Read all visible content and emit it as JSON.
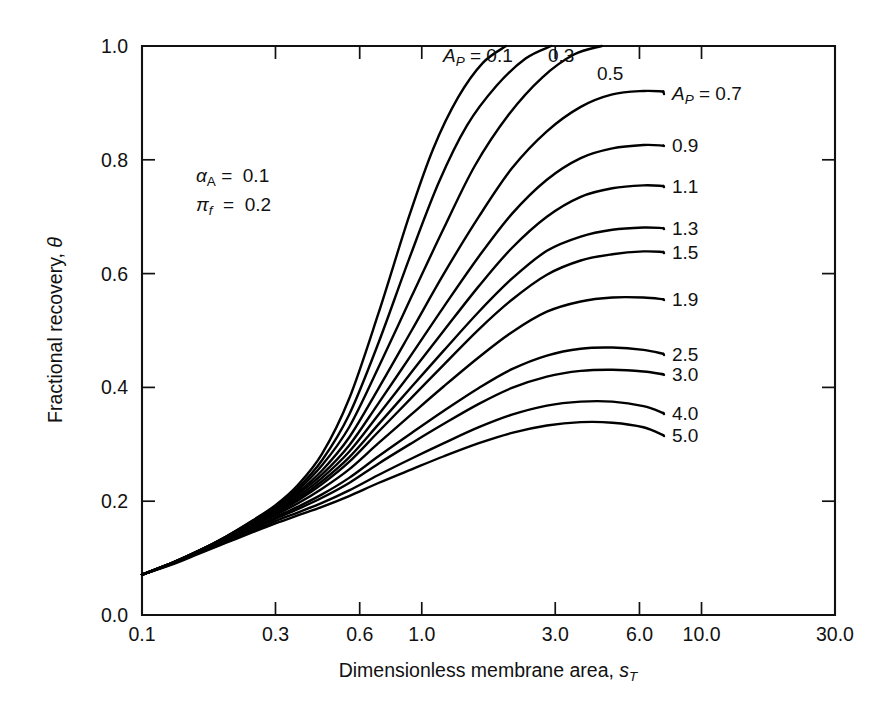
{
  "chart_data": {
    "type": "line",
    "title": "",
    "xlabel": "Dimensionless membrane area, s_T",
    "xlabel_main": "Dimensionless membrane area,",
    "xlabel_sym": "s",
    "xlabel_sub": "T",
    "ylabel": "Fractional recovery, θ",
    "ylabel_main": "Fractional recovery,",
    "ylabel_sym": "θ",
    "xscale": "log",
    "yscale": "linear",
    "xlim": [
      0.1,
      30.0
    ],
    "ylim": [
      0.0,
      1.0
    ],
    "grid": false,
    "legend": "inline-curve-labels",
    "xticks": [
      0.1,
      0.3,
      0.6,
      1.0,
      3.0,
      6.0,
      10.0,
      30.0
    ],
    "xticklabels": [
      "0.1",
      "0.3",
      "0.6",
      "1.0",
      "3.0",
      "6.0",
      "10.0",
      "30.0"
    ],
    "yticks": [
      0.0,
      0.2,
      0.4,
      0.6,
      0.8,
      1.0
    ],
    "yticklabels": [
      "0.0",
      "0.2",
      "0.4",
      "0.6",
      "0.8",
      "1.0"
    ],
    "annotations": [
      {
        "id": "alpha",
        "sym": "α",
        "sub": "A",
        "eq": "=",
        "value": "0.1"
      },
      {
        "id": "pi",
        "sym": "π",
        "sub": "f",
        "eq": "=",
        "value": "0.2"
      }
    ],
    "parameter_symbol": "A",
    "parameter_subscript": "P",
    "series": [
      {
        "name": "0.1",
        "label": "A_P = 0.1",
        "label_kind": "full",
        "plateau": 1.0,
        "x": [
          0.1,
          0.13,
          0.16,
          0.2,
          0.25,
          0.3,
          0.36,
          0.44,
          0.55,
          0.7,
          0.9,
          1.1,
          1.35,
          1.65,
          2.0
        ],
        "y": [
          0.071,
          0.093,
          0.113,
          0.138,
          0.167,
          0.193,
          0.228,
          0.283,
          0.38,
          0.53,
          0.7,
          0.82,
          0.91,
          0.97,
          1.0
        ]
      },
      {
        "name": "0.3",
        "label": "0.3",
        "label_kind": "short",
        "plateau": 1.0,
        "x": [
          0.1,
          0.13,
          0.16,
          0.2,
          0.25,
          0.3,
          0.36,
          0.44,
          0.55,
          0.7,
          0.9,
          1.15,
          1.45,
          1.85,
          2.35,
          2.9
        ],
        "y": [
          0.071,
          0.093,
          0.113,
          0.138,
          0.166,
          0.191,
          0.223,
          0.272,
          0.352,
          0.478,
          0.625,
          0.76,
          0.86,
          0.93,
          0.978,
          1.0
        ]
      },
      {
        "name": "0.5",
        "label": "0.5",
        "label_kind": "short",
        "plateau": 1.0,
        "x": [
          0.1,
          0.13,
          0.16,
          0.2,
          0.25,
          0.3,
          0.36,
          0.44,
          0.55,
          0.7,
          0.92,
          1.2,
          1.55,
          2.05,
          2.7,
          3.5,
          4.4
        ],
        "y": [
          0.071,
          0.093,
          0.113,
          0.137,
          0.165,
          0.189,
          0.219,
          0.263,
          0.33,
          0.435,
          0.56,
          0.68,
          0.79,
          0.88,
          0.945,
          0.985,
          1.0
        ]
      },
      {
        "name": "0.7",
        "label": "A_P = 0.7",
        "label_kind": "full",
        "plateau": 0.92,
        "x": [
          0.1,
          0.13,
          0.16,
          0.2,
          0.25,
          0.3,
          0.36,
          0.44,
          0.55,
          0.7,
          0.92,
          1.2,
          1.6,
          2.1,
          2.8,
          3.7,
          4.8,
          6.2,
          7.3
        ],
        "y": [
          0.071,
          0.093,
          0.113,
          0.137,
          0.164,
          0.187,
          0.215,
          0.254,
          0.312,
          0.398,
          0.5,
          0.6,
          0.7,
          0.785,
          0.85,
          0.893,
          0.915,
          0.921,
          0.92
        ]
      },
      {
        "name": "0.9",
        "label": "0.9",
        "label_kind": "short",
        "plateau": 0.825,
        "x": [
          0.1,
          0.13,
          0.16,
          0.2,
          0.25,
          0.3,
          0.36,
          0.44,
          0.55,
          0.7,
          0.92,
          1.2,
          1.6,
          2.1,
          2.8,
          3.7,
          4.8,
          6.2,
          7.3
        ],
        "y": [
          0.071,
          0.093,
          0.112,
          0.136,
          0.162,
          0.185,
          0.212,
          0.247,
          0.298,
          0.372,
          0.458,
          0.542,
          0.63,
          0.705,
          0.765,
          0.803,
          0.82,
          0.826,
          0.825
        ]
      },
      {
        "name": "1.1",
        "label": "1.1",
        "label_kind": "short",
        "plateau": 0.754,
        "x": [
          0.1,
          0.13,
          0.16,
          0.2,
          0.25,
          0.3,
          0.36,
          0.44,
          0.55,
          0.7,
          0.92,
          1.2,
          1.6,
          2.1,
          2.8,
          3.7,
          4.8,
          6.2,
          7.3
        ],
        "y": [
          0.071,
          0.092,
          0.112,
          0.135,
          0.161,
          0.183,
          0.208,
          0.241,
          0.287,
          0.352,
          0.427,
          0.5,
          0.578,
          0.645,
          0.7,
          0.735,
          0.75,
          0.755,
          0.754
        ]
      },
      {
        "name": "1.3",
        "label": "1.3",
        "label_kind": "short",
        "plateau": 0.68,
        "x": [
          0.1,
          0.13,
          0.16,
          0.2,
          0.25,
          0.3,
          0.36,
          0.44,
          0.55,
          0.7,
          0.92,
          1.2,
          1.6,
          2.1,
          2.8,
          3.7,
          4.8,
          6.2,
          7.3
        ],
        "y": [
          0.071,
          0.092,
          0.112,
          0.134,
          0.159,
          0.181,
          0.204,
          0.235,
          0.277,
          0.335,
          0.401,
          0.465,
          0.533,
          0.591,
          0.64,
          0.665,
          0.677,
          0.681,
          0.68
        ]
      },
      {
        "name": "1.5",
        "label": "1.5",
        "label_kind": "short",
        "plateau": 0.638,
        "x": [
          0.1,
          0.13,
          0.16,
          0.2,
          0.25,
          0.3,
          0.36,
          0.44,
          0.55,
          0.7,
          0.92,
          1.2,
          1.6,
          2.1,
          2.8,
          3.7,
          4.8,
          6.2,
          7.3
        ],
        "y": [
          0.071,
          0.092,
          0.111,
          0.133,
          0.158,
          0.179,
          0.201,
          0.23,
          0.269,
          0.322,
          0.382,
          0.44,
          0.502,
          0.554,
          0.598,
          0.623,
          0.634,
          0.639,
          0.638
        ]
      },
      {
        "name": "1.9",
        "label": "1.9",
        "label_kind": "short",
        "plateau": 0.555,
        "x": [
          0.1,
          0.13,
          0.16,
          0.2,
          0.25,
          0.3,
          0.36,
          0.44,
          0.55,
          0.7,
          0.92,
          1.2,
          1.6,
          2.1,
          2.8,
          3.7,
          4.8,
          6.2,
          7.3
        ],
        "y": [
          0.071,
          0.092,
          0.111,
          0.132,
          0.156,
          0.176,
          0.196,
          0.222,
          0.256,
          0.302,
          0.353,
          0.402,
          0.453,
          0.497,
          0.533,
          0.551,
          0.558,
          0.558,
          0.555
        ]
      },
      {
        "name": "2.5",
        "label": "2.5",
        "label_kind": "short",
        "plateau": 0.459,
        "x": [
          0.1,
          0.13,
          0.16,
          0.2,
          0.25,
          0.3,
          0.36,
          0.44,
          0.55,
          0.7,
          0.92,
          1.2,
          1.6,
          2.1,
          2.8,
          3.7,
          4.8,
          6.2,
          7.3
        ],
        "y": [
          0.071,
          0.091,
          0.11,
          0.131,
          0.153,
          0.172,
          0.19,
          0.212,
          0.241,
          0.279,
          0.32,
          0.359,
          0.399,
          0.432,
          0.456,
          0.468,
          0.47,
          0.466,
          0.459
        ]
      },
      {
        "name": "3.0",
        "label": "3.0",
        "label_kind": "short",
        "plateau": 0.423,
        "x": [
          0.1,
          0.13,
          0.16,
          0.2,
          0.25,
          0.3,
          0.36,
          0.44,
          0.55,
          0.7,
          0.92,
          1.2,
          1.6,
          2.1,
          2.8,
          3.7,
          4.8,
          6.2,
          7.3
        ],
        "y": [
          0.071,
          0.091,
          0.11,
          0.13,
          0.151,
          0.169,
          0.186,
          0.206,
          0.232,
          0.266,
          0.302,
          0.336,
          0.371,
          0.399,
          0.419,
          0.429,
          0.431,
          0.428,
          0.423
        ]
      },
      {
        "name": "4.0",
        "label": "4.0",
        "label_kind": "short",
        "plateau": 0.355,
        "x": [
          0.1,
          0.13,
          0.16,
          0.2,
          0.25,
          0.3,
          0.36,
          0.44,
          0.55,
          0.7,
          0.92,
          1.2,
          1.6,
          2.1,
          2.8,
          3.7,
          4.8,
          6.2,
          7.3
        ],
        "y": [
          0.071,
          0.091,
          0.109,
          0.128,
          0.148,
          0.165,
          0.18,
          0.197,
          0.219,
          0.246,
          0.275,
          0.302,
          0.33,
          0.352,
          0.368,
          0.375,
          0.375,
          0.367,
          0.355
        ]
      },
      {
        "name": "5.0",
        "label": "5.0",
        "label_kind": "short",
        "plateau": 0.316,
        "x": [
          0.1,
          0.13,
          0.16,
          0.2,
          0.25,
          0.3,
          0.36,
          0.44,
          0.55,
          0.7,
          0.92,
          1.2,
          1.6,
          2.1,
          2.8,
          3.7,
          4.8,
          6.2,
          7.3
        ],
        "y": [
          0.071,
          0.09,
          0.108,
          0.127,
          0.146,
          0.161,
          0.175,
          0.19,
          0.209,
          0.232,
          0.256,
          0.279,
          0.302,
          0.32,
          0.333,
          0.339,
          0.338,
          0.33,
          0.316
        ]
      }
    ],
    "curve_labels": [
      {
        "text": "A_P = 0.1",
        "kind": "full",
        "value": "0.1",
        "x": 443,
        "y": 62
      },
      {
        "text": "0.3",
        "kind": "short",
        "value": "0.3",
        "x": 548,
        "y": 62
      },
      {
        "text": "0.5",
        "kind": "short",
        "value": "0.5",
        "x": 597,
        "y": 80
      },
      {
        "text": "A_P = 0.7",
        "kind": "full",
        "value": "0.7",
        "x": 672,
        "y": 100
      },
      {
        "text": "0.9",
        "kind": "short",
        "value": "0.9",
        "x": 672,
        "y": 152
      },
      {
        "text": "1.1",
        "kind": "short",
        "value": "1.1",
        "x": 672,
        "y": 193
      },
      {
        "text": "1.3",
        "kind": "short",
        "value": "1.3",
        "x": 672,
        "y": 235
      },
      {
        "text": "1.5",
        "kind": "short",
        "value": "1.5",
        "x": 672,
        "y": 259
      },
      {
        "text": "1.9",
        "kind": "short",
        "value": "1.9",
        "x": 672,
        "y": 306
      },
      {
        "text": "2.5",
        "kind": "short",
        "value": "2.5",
        "x": 672,
        "y": 361
      },
      {
        "text": "3.0",
        "kind": "short",
        "value": "3.0",
        "x": 672,
        "y": 381
      },
      {
        "text": "4.0",
        "kind": "short",
        "value": "4.0",
        "x": 672,
        "y": 420
      },
      {
        "text": "5.0",
        "kind": "short",
        "value": "5.0",
        "x": 672,
        "y": 442
      }
    ]
  },
  "figure": {
    "background_color": "#ffffff",
    "line_color": "#000000",
    "text_color": "#111111"
  }
}
